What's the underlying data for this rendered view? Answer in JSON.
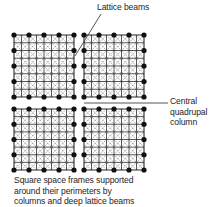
{
  "labels": {
    "lattice_beams": "Lattice beams",
    "central_column": [
      "Central",
      "quadrupal",
      "column"
    ],
    "caption": [
      "Square space frames supported",
      "around their perimeters by",
      "columns and deep lattice beams"
    ]
  },
  "colors": {
    "line": "#2a2a2a",
    "diagonal": "#7a7a7a",
    "node": "#111111"
  },
  "frames": [
    {
      "name": "top-left",
      "x0": 14,
      "y0": 35,
      "x1": 74,
      "y1": 97
    },
    {
      "name": "top-right",
      "x0": 84,
      "y0": 35,
      "x1": 144,
      "y1": 97
    },
    {
      "name": "bottom-left",
      "x0": 14,
      "y0": 109,
      "x1": 74,
      "y1": 170
    },
    {
      "name": "bottom-right",
      "x0": 84,
      "y0": 109,
      "x1": 144,
      "y1": 170
    }
  ],
  "frame_divisions": 8,
  "column_spacing_divisions": 2,
  "leaders": {
    "lattice": {
      "x1": 101,
      "y1": 14,
      "x2": 75,
      "y2": 56
    },
    "central": {
      "x1": 84,
      "y1": 103,
      "x2": 168,
      "y2": 103
    }
  }
}
